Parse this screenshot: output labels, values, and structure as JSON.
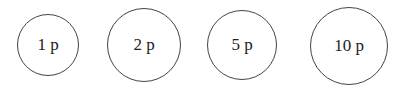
{
  "coins": [
    {
      "label": "1 p",
      "cx": 48,
      "cy": 45,
      "r": 31
    },
    {
      "label": "2 p",
      "cx": 146,
      "cy": 45,
      "r": 37
    },
    {
      "label": "5 p",
      "cx": 242,
      "cy": 45,
      "r": 35
    },
    {
      "label": "10 p",
      "cx": 349,
      "cy": 46,
      "r": 39
    }
  ]
}
